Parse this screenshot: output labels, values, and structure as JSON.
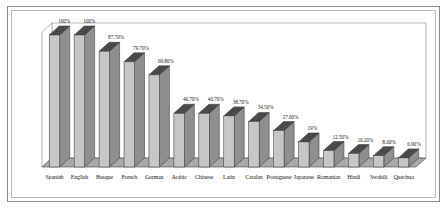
{
  "chart_data": {
    "type": "bar",
    "title": "",
    "subtitle": "",
    "xlabel": "",
    "ylabel": "",
    "ylim": [
      0,
      100
    ],
    "grid": false,
    "legend": "none",
    "style": "3d-perspective-column",
    "categories": [
      "Spanish",
      "English",
      "Basque",
      "French",
      "German",
      "Arabic",
      "Chinese",
      "Latin",
      "Catalan",
      "Portuguese",
      "Japanese",
      "Romanian",
      "Hindi",
      "Swahili",
      "Quechua"
    ],
    "values": [
      100,
      100,
      87.7,
      79.7,
      69.8,
      40.7,
      40.7,
      38.7,
      34.5,
      27.6,
      19,
      12.5,
      10.2,
      8.6,
      6.9
    ],
    "data_labels": [
      "100%",
      "100%",
      "87.70%",
      "79.70%",
      "69.80%",
      "40.70%",
      "40.70%",
      "38.70%",
      "34.50%",
      "27.60%",
      "19%",
      "12.50%",
      "10.20%",
      "8.60%",
      "6.90%"
    ],
    "colors": {
      "bar_front": "#c6c6c6",
      "bar_side": "#8f8f8f",
      "bar_top": "#4a4a4a",
      "bar_outline": "#3c3c3c",
      "floor": "#a9a9a9",
      "floor_outline": "#5a5a5a",
      "plot_background": "#ffffff",
      "frame_outer": "#8a8a8a",
      "frame_inner": "#b9b9b9",
      "text": "#1d1d1d"
    }
  }
}
